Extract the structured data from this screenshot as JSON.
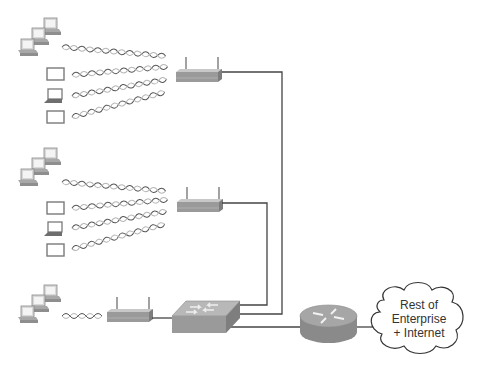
{
  "diagram": {
    "colors": {
      "wire": "#444444",
      "device_gray": "#9a9a9a",
      "device_dark": "#7d7d7d",
      "device_light": "#c4c4c4",
      "wave_a": "#555555",
      "wave_b": "#b0b0b0"
    },
    "groups": [
      {
        "id": "group-1",
        "clients": [
          "desktop-stack",
          "tablet",
          "laptop",
          "tablet"
        ],
        "wireless_links": 4,
        "access_point": "access-point-1"
      },
      {
        "id": "group-2",
        "clients": [
          "desktop-stack",
          "tablet",
          "laptop",
          "tablet"
        ],
        "wireless_links": 4,
        "access_point": "access-point-2"
      },
      {
        "id": "group-3",
        "clients": [
          "desktop-stack"
        ],
        "wireless_links": 1,
        "access_point": "access-point-3"
      }
    ],
    "switch": {
      "label": "LAN switch"
    },
    "router": {
      "label": "Router"
    },
    "cloud": {
      "line1": "Rest of",
      "line2": "Enterprise",
      "line3": "+ Internet"
    }
  }
}
